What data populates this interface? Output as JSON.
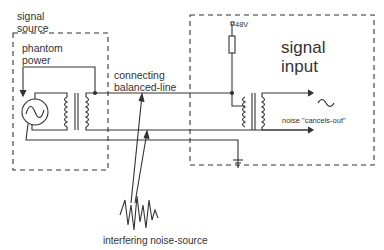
{
  "labels": {
    "source_title_line1": "signal",
    "source_title_line2": "source",
    "phantom_line1": "phantom",
    "phantom_line2": "power",
    "line_line1": "connecting",
    "line_line2": "balanced-line",
    "input_title_line1": "signal",
    "input_title_line2": "input",
    "voltage": "48V",
    "noise_cancel": "noise \"cancels-out\"",
    "noise_source": "interfering noise-source"
  },
  "colors": {
    "line": "#333333",
    "dash": "#444444",
    "background": "#ffffff"
  }
}
